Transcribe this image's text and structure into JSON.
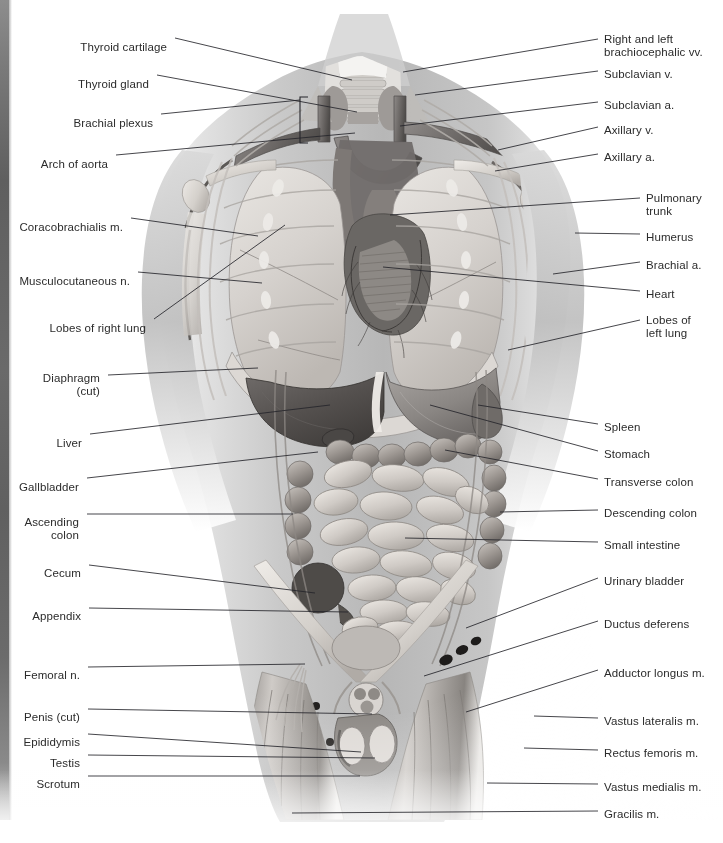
{
  "plate": {
    "title": "Anterior view of human torso with thoracic and abdominal viscera",
    "style": "grayscale medical illustration",
    "background_color": "#ffffff",
    "text_color": "#2b2b2b",
    "leader_line_color": "#25252a",
    "edge_strip_color": "#6a6a6a"
  },
  "labels_left": [
    {
      "id": "thyroid-cartilage",
      "text": "Thyroid cartilage",
      "tx": 167,
      "ty": 41,
      "lx1": 175,
      "ly1": 38,
      "lx2": 352,
      "ly2": 80
    },
    {
      "id": "thyroid-gland",
      "text": "Thyroid gland",
      "tx": 149,
      "ty": 78,
      "lx1": 157,
      "ly1": 75,
      "lx2": 357,
      "ly2": 112
    },
    {
      "id": "brachial-plexus",
      "text": "Brachial plexus",
      "tx": 153,
      "ty": 117,
      "lx1": 161,
      "ly1": 114,
      "lx2": 300,
      "ly2": 100
    },
    {
      "id": "arch-of-aorta",
      "text": "Arch of aorta",
      "tx": 108,
      "ty": 158,
      "lx1": 116,
      "ly1": 155,
      "lx2": 355,
      "ly2": 133
    },
    {
      "id": "coracobrachialis-m",
      "text": "Coracobrachialis m.",
      "tx": 123,
      "ty": 221,
      "lx1": 131,
      "ly1": 218,
      "lx2": 258,
      "ly2": 236
    },
    {
      "id": "musculocutaneous-n",
      "text": "Musculocutaneous n.",
      "tx": 130,
      "ty": 275,
      "lx1": 138,
      "ly1": 272,
      "lx2": 262,
      "ly2": 283
    },
    {
      "id": "lobes-of-right-lung",
      "text": "Lobes of right lung",
      "tx": 146,
      "ty": 322,
      "lx1": 154,
      "ly1": 319,
      "lx2": 285,
      "ly2": 225
    },
    {
      "id": "diaphragm-cut",
      "text": "Diaphragm\n(cut)",
      "tx": 100,
      "ty": 372,
      "lx1": 108,
      "ly1": 375,
      "lx2": 258,
      "ly2": 368
    },
    {
      "id": "liver",
      "text": "Liver",
      "tx": 82,
      "ty": 437,
      "lx1": 90,
      "ly1": 434,
      "lx2": 330,
      "ly2": 405
    },
    {
      "id": "gallbladder",
      "text": "Gallbladder",
      "tx": 79,
      "ty": 481,
      "lx1": 87,
      "ly1": 478,
      "lx2": 318,
      "ly2": 452
    },
    {
      "id": "ascending-colon",
      "text": "Ascending colon",
      "tx": 79,
      "ty": 516,
      "lx1": 87,
      "ly1": 514,
      "lx2": 293,
      "ly2": 514
    },
    {
      "id": "cecum",
      "text": "Cecum",
      "tx": 81,
      "ty": 567,
      "lx1": 89,
      "ly1": 565,
      "lx2": 315,
      "ly2": 593
    },
    {
      "id": "appendix",
      "text": "Appendix",
      "tx": 81,
      "ty": 610,
      "lx1": 89,
      "ly1": 608,
      "lx2": 348,
      "ly2": 612
    },
    {
      "id": "femoral-n",
      "text": "Femoral n.",
      "tx": 80,
      "ty": 669,
      "lx1": 88,
      "ly1": 667,
      "lx2": 305,
      "ly2": 664
    },
    {
      "id": "penis-cut",
      "text": "Penis (cut)",
      "tx": 80,
      "ty": 711,
      "lx1": 88,
      "ly1": 709,
      "lx2": 372,
      "ly2": 714
    },
    {
      "id": "epididymis",
      "text": "Epididymis",
      "tx": 80,
      "ty": 736,
      "lx1": 88,
      "ly1": 734,
      "lx2": 361,
      "ly2": 752
    },
    {
      "id": "testis",
      "text": "Testis",
      "tx": 80,
      "ty": 757,
      "lx1": 88,
      "ly1": 755,
      "lx2": 375,
      "ly2": 758
    },
    {
      "id": "scrotum",
      "text": "Scrotum",
      "tx": 80,
      "ty": 778,
      "lx1": 88,
      "ly1": 776,
      "lx2": 360,
      "ly2": 776
    }
  ],
  "labels_right": [
    {
      "id": "brachiocephalic-vv",
      "text": "Right and left\nbrachiocephalic vv.",
      "tx": 604,
      "ty": 33,
      "lx1": 598,
      "ly1": 39,
      "lx2": 403,
      "ly2": 72
    },
    {
      "id": "subclavian-v",
      "text": "Subclavian v.",
      "tx": 604,
      "ty": 68,
      "lx1": 598,
      "ly1": 71,
      "lx2": 415,
      "ly2": 95
    },
    {
      "id": "subclavian-a",
      "text": "Subclavian a.",
      "tx": 604,
      "ty": 99,
      "lx1": 598,
      "ly1": 102,
      "lx2": 400,
      "ly2": 126
    },
    {
      "id": "axillary-v",
      "text": "Axillary v.",
      "tx": 604,
      "ty": 124,
      "lx1": 598,
      "ly1": 127,
      "lx2": 498,
      "ly2": 150
    },
    {
      "id": "axillary-a",
      "text": "Axillary a.",
      "tx": 604,
      "ty": 151,
      "lx1": 598,
      "ly1": 154,
      "lx2": 495,
      "ly2": 171
    },
    {
      "id": "pulmonary-trunk",
      "text": "Pulmonary\ntrunk",
      "tx": 646,
      "ty": 192,
      "lx1": 640,
      "ly1": 198,
      "lx2": 390,
      "ly2": 215
    },
    {
      "id": "humerus",
      "text": "Humerus",
      "tx": 646,
      "ty": 231,
      "lx1": 640,
      "ly1": 234,
      "lx2": 575,
      "ly2": 233
    },
    {
      "id": "brachial-a",
      "text": "Brachial a.",
      "tx": 646,
      "ty": 259,
      "lx1": 640,
      "ly1": 262,
      "lx2": 553,
      "ly2": 274
    },
    {
      "id": "heart",
      "text": "Heart",
      "tx": 646,
      "ty": 288,
      "lx1": 640,
      "ly1": 291,
      "lx2": 383,
      "ly2": 267
    },
    {
      "id": "lobes-of-left-lung",
      "text": "Lobes of\nleft lung",
      "tx": 646,
      "ty": 314,
      "lx1": 640,
      "ly1": 320,
      "lx2": 508,
      "ly2": 350
    },
    {
      "id": "spleen",
      "text": "Spleen",
      "tx": 604,
      "ty": 421,
      "lx1": 598,
      "ly1": 424,
      "lx2": 478,
      "ly2": 405
    },
    {
      "id": "stomach",
      "text": "Stomach",
      "tx": 604,
      "ty": 448,
      "lx1": 598,
      "ly1": 451,
      "lx2": 430,
      "ly2": 405
    },
    {
      "id": "transverse-colon",
      "text": "Transverse colon",
      "tx": 604,
      "ty": 476,
      "lx1": 598,
      "ly1": 479,
      "lx2": 445,
      "ly2": 450
    },
    {
      "id": "descending-colon",
      "text": "Descending colon",
      "tx": 604,
      "ty": 507,
      "lx1": 598,
      "ly1": 510,
      "lx2": 500,
      "ly2": 512
    },
    {
      "id": "small-intestine",
      "text": "Small intestine",
      "tx": 604,
      "ty": 539,
      "lx1": 598,
      "ly1": 542,
      "lx2": 405,
      "ly2": 538
    },
    {
      "id": "urinary-bladder",
      "text": "Urinary bladder",
      "tx": 604,
      "ty": 575,
      "lx1": 598,
      "ly1": 578,
      "lx2": 466,
      "ly2": 628
    },
    {
      "id": "ductus-deferens",
      "text": "Ductus deferens",
      "tx": 604,
      "ty": 618,
      "lx1": 598,
      "ly1": 621,
      "lx2": 424,
      "ly2": 676
    },
    {
      "id": "adductor-longus-m",
      "text": "Adductor longus m.",
      "tx": 604,
      "ty": 667,
      "lx1": 598,
      "ly1": 670,
      "lx2": 466,
      "ly2": 712
    },
    {
      "id": "vastus-lateralis-m",
      "text": "Vastus lateralis m.",
      "tx": 604,
      "ty": 715,
      "lx1": 598,
      "ly1": 718,
      "lx2": 534,
      "ly2": 716
    },
    {
      "id": "rectus-femoris-m",
      "text": "Rectus femoris m.",
      "tx": 604,
      "ty": 747,
      "lx1": 598,
      "ly1": 750,
      "lx2": 524,
      "ly2": 748
    },
    {
      "id": "vastus-medialis-m",
      "text": "Vastus medialis m.",
      "tx": 604,
      "ty": 781,
      "lx1": 598,
      "ly1": 784,
      "lx2": 487,
      "ly2": 783
    },
    {
      "id": "gracilis-m",
      "text": "Gracilis m.",
      "tx": 604,
      "ty": 808,
      "lx1": 598,
      "ly1": 811,
      "lx2": 292,
      "ly2": 813
    }
  ],
  "anatomy_regions": [
    {
      "id": "neck",
      "name": "Neck and laryngeal region"
    },
    {
      "id": "thorax",
      "name": "Thoracic cavity with lungs and heart"
    },
    {
      "id": "abdomen",
      "name": "Abdominal cavity with liver, stomach and intestines"
    },
    {
      "id": "pelvis",
      "name": "Pelvic region with bladder and external genitalia"
    },
    {
      "id": "upper-limbs",
      "name": "Shoulders and upper arms"
    },
    {
      "id": "thighs",
      "name": "Proximal thighs"
    }
  ]
}
